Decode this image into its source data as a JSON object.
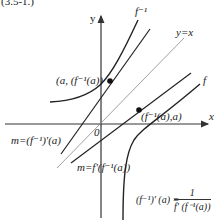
{
  "caption_fragment": "(3.5-1.)",
  "axes": {
    "x_label": "x",
    "y_label": "y",
    "origin_label": "0"
  },
  "curves": {
    "f_label": "f",
    "f_inverse_label": "f⁻¹",
    "identity_line_label": "y=x"
  },
  "points": {
    "on_f_inverse": "(a, (f⁻¹(a))",
    "on_f": "(f⁻¹(a),a)"
  },
  "tangent_slopes": {
    "inverse_tangent": "m=(f⁻¹)'(a)",
    "f_tangent": "m=f'(f⁻¹(a))"
  },
  "formula": {
    "lhs": "(f⁻¹)' (a) =",
    "numerator": "1",
    "denominator": "f' (f⁻¹(a))"
  },
  "colors": {
    "curve": "#222222",
    "axis": "#333333",
    "identity_line": "#888888",
    "background": "#ffffff"
  }
}
